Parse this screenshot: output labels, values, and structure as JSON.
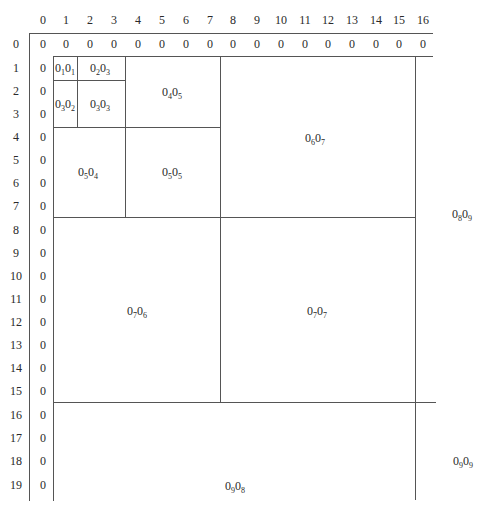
{
  "column_headers": [
    "0",
    "1",
    "2",
    "3",
    "4",
    "5",
    "6",
    "7",
    "8",
    "9",
    "10",
    "11",
    "12",
    "13",
    "14",
    "15",
    "16"
  ],
  "row_headers": [
    "0",
    "1",
    "2",
    "3",
    "4",
    "5",
    "6",
    "7",
    "8",
    "9",
    "10",
    "11",
    "12",
    "13",
    "14",
    "15",
    "16",
    "17",
    "18",
    "19"
  ],
  "row0_values": [
    "0",
    "0",
    "0",
    "0",
    "0",
    "0",
    "0",
    "0",
    "0",
    "0",
    "0",
    "0",
    "0",
    "0",
    "0",
    "0",
    "0"
  ],
  "col0_values": [
    "0",
    "0",
    "0",
    "0",
    "0",
    "0",
    "0",
    "0",
    "0",
    "0",
    "0",
    "0",
    "0",
    "0",
    "0",
    "0",
    "0",
    "0",
    "0"
  ],
  "blocks": [
    {
      "id": "b11",
      "base": "0",
      "sub1": "1",
      "sub2": "1"
    },
    {
      "id": "b23",
      "base": "0",
      "sub1": "2",
      "sub2": "3"
    },
    {
      "id": "b32",
      "base": "0",
      "sub1": "3",
      "sub2": "2"
    },
    {
      "id": "b33",
      "base": "0",
      "sub1": "3",
      "sub2": "3"
    },
    {
      "id": "b45",
      "base": "0",
      "sub1": "4",
      "sub2": "5"
    },
    {
      "id": "b54",
      "base": "0",
      "sub1": "5",
      "sub2": "4"
    },
    {
      "id": "b55",
      "base": "0",
      "sub1": "5",
      "sub2": "5"
    },
    {
      "id": "b67",
      "base": "0",
      "sub1": "6",
      "sub2": "7"
    },
    {
      "id": "b76",
      "base": "0",
      "sub1": "7",
      "sub2": "6"
    },
    {
      "id": "b77",
      "base": "0",
      "sub1": "7",
      "sub2": "7"
    },
    {
      "id": "b89",
      "base": "0",
      "sub1": "8",
      "sub2": "9"
    },
    {
      "id": "b98",
      "base": "0",
      "sub1": "9",
      "sub2": "8"
    },
    {
      "id": "b99",
      "base": "0",
      "sub1": "9",
      "sub2": "9"
    }
  ],
  "colors": {
    "line": "#555555",
    "text": "#2a2a2a",
    "background": "#ffffff"
  }
}
